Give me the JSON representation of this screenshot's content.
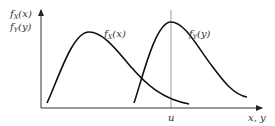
{
  "figure": {
    "y_axis_label_line1": {
      "f": "f",
      "sub": "X",
      "arg": "(x)"
    },
    "y_axis_label_line2": {
      "f": "f",
      "sub": "Y",
      "arg": "(y)"
    },
    "x_axis_label": "x, y",
    "curves": [
      {
        "name": "f_X",
        "label": {
          "f": "f",
          "sub": "X",
          "arg": "(x)"
        }
      },
      {
        "name": "f_Y",
        "label": {
          "f": "f",
          "sub": "Y",
          "arg": "(y)"
        }
      }
    ],
    "marker": {
      "label": "u"
    },
    "colors": {
      "curve": "#111111",
      "axis": "#333333",
      "marker_line": "#999999",
      "text": "#333333"
    }
  }
}
